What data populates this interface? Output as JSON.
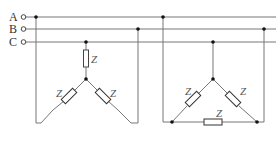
{
  "diagram": {
    "type": "three-phase circuit",
    "lines": [
      {
        "id": "A",
        "label": "A",
        "y": 17
      },
      {
        "id": "B",
        "label": "B",
        "y": 29
      },
      {
        "id": "C",
        "label": "C",
        "y": 42
      }
    ],
    "loads": [
      {
        "name": "star (Y) connection",
        "impedance_labels": [
          "Z",
          "Z",
          "Z"
        ]
      },
      {
        "name": "delta (Δ) connection",
        "impedance_labels": [
          "Z",
          "Z",
          "Z"
        ]
      }
    ],
    "impedance_symbol": "Z",
    "colors": {
      "wire": "#777777",
      "node": "#111111",
      "text": "#333333"
    }
  }
}
